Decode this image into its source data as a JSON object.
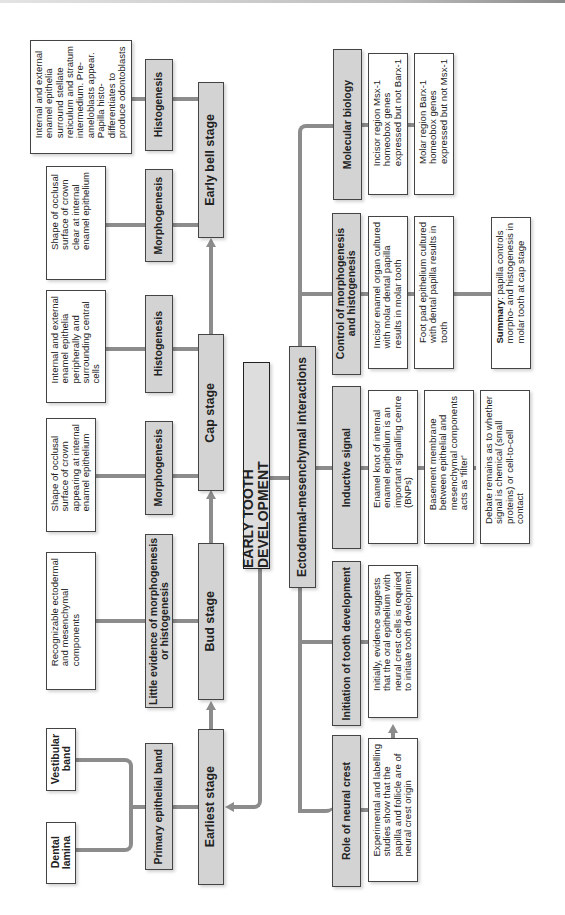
{
  "title": "EARLY TOOTH DEVELOPMENT",
  "branch": "Ectodermal-mesenchymal interactions",
  "stages": [
    {
      "name": "Earliest stage",
      "sub": {
        "label": "Primary epithelial band",
        "children": [
          "Dental\nlamina",
          "Vestibular\nband"
        ]
      }
    },
    {
      "name": "Bud stage",
      "sub": {
        "label": "Little evidence of morphogenesis\nor histogenesis",
        "text": "Recognizable ectodermal\nand mesenchymal\ncomponents"
      }
    },
    {
      "name": "Cap stage",
      "morph": {
        "label": "Morphogenesis",
        "text": "Shape of occlusal\nsurface of crown\nappearing at internal\nenamel epithelium"
      },
      "histo": {
        "label": "Histogenesis",
        "text": "Internal and external\nenamel epithelia\nperipherally and\nsurrounding central\ncells"
      }
    },
    {
      "name": "Early bell stage",
      "morph": {
        "label": "Morphogenesis",
        "text": "Shape of occlusal\nsurface of crown\nclear at internal\nenamel epithelium"
      },
      "histo": {
        "label": "Histogenesis",
        "text": "Internal and external\nenamel epithelia\nsurround stellate\nreticulum and stratum\nintermedium. Pre-\nameloblasts appear.\nPapilla histo-\ndifferentiates to\nproduce odontoblasts"
      }
    }
  ],
  "interactions": [
    {
      "label": "Role of neural crest",
      "items": [
        "Experimental and labelling\nstudies show that the\npapilla and follicle are of\nneural crest origin"
      ]
    },
    {
      "label": "Initiation of tooth development",
      "items": [
        "Initially, evidence suggests\nthat the oral epithelium with\nneural crest cells is required\nto initiate tooth development"
      ]
    },
    {
      "label": "Inductive signal",
      "items": [
        "Enamel knot of internal\nenamel epithelium is an\nimportant signalling centre\n(BNPs)",
        "Basement membrane\nbetween epithelial and\nmesenchymal components\nacts as 'filter'",
        "Debate remains as to whether\nsignal is chemical (small\nproteins) or cell-to-cell\ncontact"
      ]
    },
    {
      "label": "Control of morphogenesis\nand histogenesis",
      "items": [
        "Incisor enamel organ cultured\nwith molar dental papilla\nresults in molar tooth",
        "Foot pad epithelium cultured\nwith dental papilla results in\ntooth"
      ],
      "summary": {
        "bold": "Summary",
        "text": ": papilla controls\nmorpho- and histogenesis in\nmolar tooth at cap stage"
      }
    },
    {
      "label": "Molecular biology",
      "items": [
        "Incisor region Msx-1\nhomeobox genes\nexpressed but not Barx-1",
        "Molar region Barx-1\nhomeobox genes\nexpressed but not Msx-1"
      ]
    }
  ]
}
